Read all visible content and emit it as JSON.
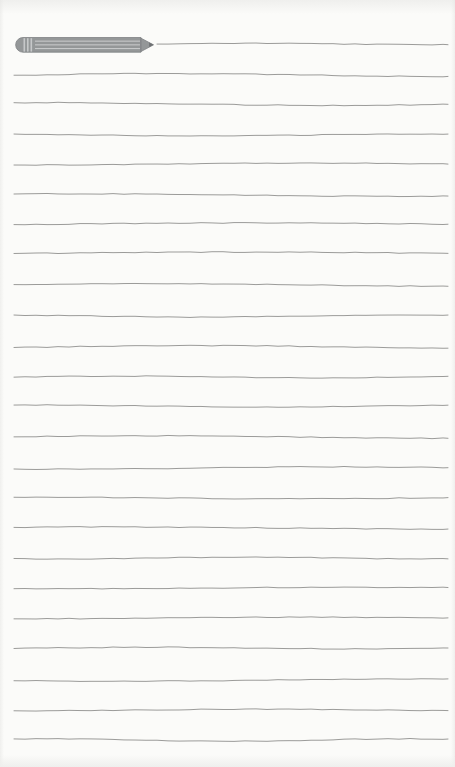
{
  "page": {
    "kind": "blank-lined-notepad-page",
    "width": 455,
    "height": 767,
    "background_color": "#fbfbf9",
    "edge_shade_color": "#efefed",
    "text_content": ""
  },
  "ruling": {
    "line_color": "#9b9b99",
    "line_thickness": 1,
    "line_count": 24,
    "left_margin_x": 14,
    "right_margin_x": 448,
    "first_line_start_x": 157,
    "average_line_spacing": 30,
    "line_y_positions": [
      44,
      75,
      104,
      135,
      164,
      195,
      224,
      253,
      285,
      316,
      347,
      377,
      406,
      437,
      468,
      498,
      528,
      558,
      588,
      618,
      648,
      680,
      710,
      740
    ]
  },
  "pencil": {
    "icon_name": "pencil-icon",
    "x": 14,
    "y": 36,
    "body_length": 126,
    "tip_length": 13,
    "thickness": 16,
    "body_color": "#949798",
    "stripe_color": "#c6c8c9",
    "outline_color": "#7f8284",
    "tip_point_color": "#6e7173"
  }
}
